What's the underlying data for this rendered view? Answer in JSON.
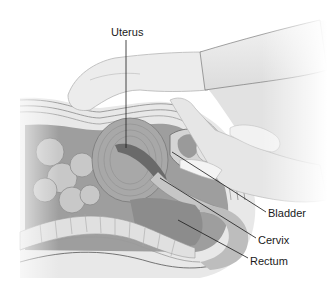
{
  "figure": {
    "labels": [
      {
        "id": "uterus",
        "text": "Uterus"
      },
      {
        "id": "bladder",
        "text": "Bladder"
      },
      {
        "id": "cervix",
        "text": "Cervix"
      },
      {
        "id": "rectum",
        "text": "Rectum"
      }
    ]
  },
  "colors": {
    "background": "#ffffff",
    "skin": "#e6e6e6",
    "glove": "#ececec",
    "cavity": "#9a9a9a",
    "organ_dark": "#7d7d7d",
    "organ_mid": "#b4b4b4",
    "leader_line": "#1a1a1a",
    "label_text": "#1a1a1a"
  }
}
